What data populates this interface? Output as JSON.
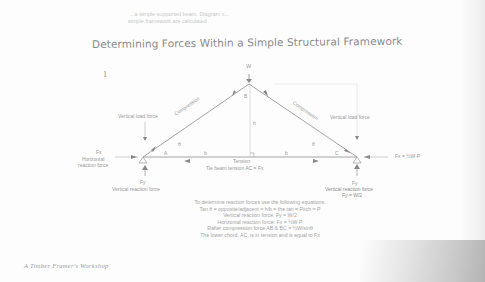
{
  "bleed_text": [
    "...a simple supported beam. Diagram x...",
    "simple framework are calculated"
  ],
  "title": "Determining Forces Within a Simple Structural Framework",
  "figure_number": "1",
  "diagram": {
    "apex_load": "W",
    "node_b": "B",
    "node_a": "A",
    "node_c": "C",
    "height_label": "h",
    "half_span_left": "b",
    "half_span_right": "b",
    "angle_left": "θ",
    "angle_right": "θ",
    "angle_top": "θ",
    "left_member": "Compression",
    "right_member": "Compression",
    "left_vertical_load": "Vertical load force",
    "right_vertical_load": "Vertical load force",
    "left_fx": "Fx",
    "left_horizontal": "Horizontal\nreaction force",
    "right_fx": "Fx = ½W·P",
    "tension": "Tension",
    "tie_beam": "Tie beam tension AC = Fx",
    "left_fy": "Fy",
    "left_vertical_reaction": "Vertical reaction force",
    "right_fy": "Fy",
    "right_vertical_reaction": "Vertical reaction force",
    "right_fy_eq": "Fy = W/2"
  },
  "equations": [
    "To determine reaction forces use the following equations:",
    "Tan θ = opposite/adjacent = h/b = the tan = Pitch = P",
    "Vertical reaction force: Fy = W/2",
    "Horizontal reaction force: Fx = ½W·P",
    "Rafter compression force AB & BC = ½W/sinθ",
    "The lower chord, AC, is in tension and is equal to Fx"
  ],
  "footer": "A Timber Framer's Workshop"
}
